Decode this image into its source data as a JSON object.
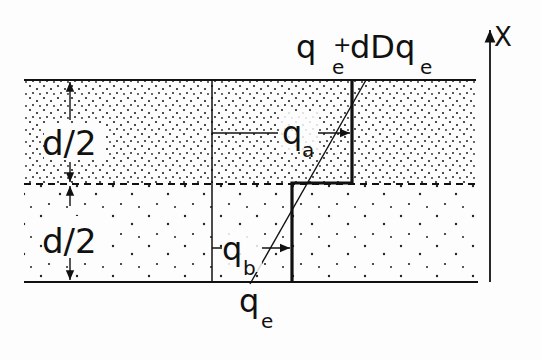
{
  "diagram": {
    "labels": {
      "top_main": "q",
      "top_sub": "e",
      "top_plus": "+",
      "top_rest": "dDq",
      "top_rest_sub": "e",
      "axis": "X",
      "upper_half": "d/2",
      "lower_half": "d/2",
      "qa_main": "q",
      "qa_sub": "a",
      "qb_main": "q",
      "qb_sub": "b",
      "bottom_main": "q",
      "bottom_sub": "e"
    },
    "layers": [
      {
        "name": "upper-layer",
        "thickness": "d/2",
        "dot_density": "dense"
      },
      {
        "name": "lower-layer",
        "thickness": "d/2",
        "dot_density": "sparse"
      }
    ],
    "colors": {
      "ink": "#111111",
      "background": "#fdfdfd"
    }
  }
}
